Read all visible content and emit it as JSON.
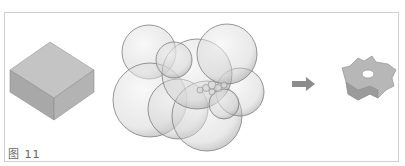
{
  "figure": {
    "caption": "图 11",
    "panels": [
      {
        "name": "solid-block",
        "description": "initial rectangular block volume"
      },
      {
        "name": "bubble-cluster",
        "description": "overlapping translucent spheres"
      },
      {
        "name": "arrow",
        "description": "right arrow indicating transformation"
      },
      {
        "name": "result-part",
        "description": "star-shaped part with central hole"
      }
    ],
    "colors": {
      "border": "#cfcfcf",
      "shape_fill": "#b9b9b9",
      "shape_dark": "#8e8e8e",
      "sphere_stroke": "#7a7a7a",
      "caption": "#666666"
    }
  }
}
